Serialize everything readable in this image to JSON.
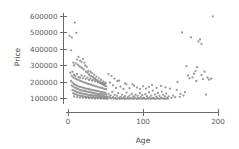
{
  "chart_data": {
    "type": "scatter",
    "title": "",
    "xlabel": "Age",
    "ylabel": "Price",
    "xlim": [
      -8,
      205
    ],
    "ylim": [
      60000,
      625000
    ],
    "grid": false,
    "legend": null,
    "marker_color": "#8a8a8a",
    "axis_color": "#6b6b6b",
    "background": "#ffffff",
    "xticks": [
      0,
      100,
      200
    ],
    "xtick_labels": [
      "0",
      "100",
      "200"
    ],
    "yticks": [
      100000,
      200000,
      300000,
      400000,
      500000,
      600000
    ],
    "ytick_labels": [
      "100000",
      "200000",
      "300000",
      "400000",
      "500000",
      "600000"
    ],
    "points": [
      [
        2,
        480000
      ],
      [
        5,
        470000
      ],
      [
        9,
        560000
      ],
      [
        11,
        498000
      ],
      [
        4,
        392000
      ],
      [
        14,
        352000
      ],
      [
        12,
        336000
      ],
      [
        16,
        330000
      ],
      [
        7,
        318000
      ],
      [
        10,
        312000
      ],
      [
        13,
        305000
      ],
      [
        8,
        300000
      ],
      [
        15,
        296000
      ],
      [
        18,
        322000
      ],
      [
        20,
        340000
      ],
      [
        22,
        318000
      ],
      [
        17,
        290000
      ],
      [
        19,
        284000
      ],
      [
        21,
        276000
      ],
      [
        23,
        300000
      ],
      [
        25,
        292000
      ],
      [
        27,
        268000
      ],
      [
        24,
        262000
      ],
      [
        26,
        256000
      ],
      [
        28,
        248000
      ],
      [
        30,
        262000
      ],
      [
        32,
        254000
      ],
      [
        29,
        240000
      ],
      [
        31,
        236000
      ],
      [
        33,
        230000
      ],
      [
        35,
        244000
      ],
      [
        34,
        226000
      ],
      [
        36,
        220000
      ],
      [
        38,
        232000
      ],
      [
        37,
        214000
      ],
      [
        39,
        208000
      ],
      [
        41,
        222000
      ],
      [
        40,
        204000
      ],
      [
        42,
        198000
      ],
      [
        44,
        212000
      ],
      [
        43,
        194000
      ],
      [
        45,
        190000
      ],
      [
        47,
        202000
      ],
      [
        46,
        186000
      ],
      [
        48,
        182000
      ],
      [
        50,
        196000
      ],
      [
        49,
        178000
      ],
      [
        51,
        174000
      ],
      [
        3,
        256000
      ],
      [
        6,
        262000
      ],
      [
        5,
        238000
      ],
      [
        7,
        228000
      ],
      [
        8,
        244000
      ],
      [
        9,
        222000
      ],
      [
        10,
        236000
      ],
      [
        11,
        218000
      ],
      [
        12,
        248000
      ],
      [
        13,
        214000
      ],
      [
        14,
        230000
      ],
      [
        15,
        210000
      ],
      [
        16,
        226000
      ],
      [
        17,
        206000
      ],
      [
        18,
        240000
      ],
      [
        19,
        202000
      ],
      [
        20,
        222000
      ],
      [
        21,
        198000
      ],
      [
        22,
        234000
      ],
      [
        23,
        196000
      ],
      [
        24,
        218000
      ],
      [
        25,
        192000
      ],
      [
        26,
        226000
      ],
      [
        27,
        188000
      ],
      [
        28,
        212000
      ],
      [
        29,
        186000
      ],
      [
        30,
        220000
      ],
      [
        31,
        184000
      ],
      [
        32,
        208000
      ],
      [
        33,
        180000
      ],
      [
        34,
        214000
      ],
      [
        35,
        178000
      ],
      [
        36,
        204000
      ],
      [
        37,
        174000
      ],
      [
        38,
        210000
      ],
      [
        39,
        172000
      ],
      [
        40,
        198000
      ],
      [
        41,
        168000
      ],
      [
        42,
        202000
      ],
      [
        43,
        166000
      ],
      [
        44,
        192000
      ],
      [
        45,
        164000
      ],
      [
        46,
        196000
      ],
      [
        47,
        160000
      ],
      [
        48,
        188000
      ],
      [
        49,
        158000
      ],
      [
        50,
        190000
      ],
      [
        51,
        156000
      ],
      [
        4,
        206000
      ],
      [
        6,
        196000
      ],
      [
        8,
        188000
      ],
      [
        10,
        182000
      ],
      [
        12,
        178000
      ],
      [
        14,
        174000
      ],
      [
        16,
        170000
      ],
      [
        18,
        168000
      ],
      [
        20,
        166000
      ],
      [
        22,
        162000
      ],
      [
        24,
        160000
      ],
      [
        26,
        158000
      ],
      [
        28,
        156000
      ],
      [
        30,
        154000
      ],
      [
        32,
        152000
      ],
      [
        34,
        150000
      ],
      [
        36,
        148000
      ],
      [
        38,
        146000
      ],
      [
        40,
        144000
      ],
      [
        42,
        142000
      ],
      [
        44,
        140000
      ],
      [
        46,
        138000
      ],
      [
        48,
        136000
      ],
      [
        50,
        134000
      ],
      [
        5,
        178000
      ],
      [
        7,
        172000
      ],
      [
        9,
        166000
      ],
      [
        11,
        162000
      ],
      [
        13,
        158000
      ],
      [
        15,
        154000
      ],
      [
        17,
        150000
      ],
      [
        19,
        148000
      ],
      [
        21,
        146000
      ],
      [
        23,
        144000
      ],
      [
        25,
        142000
      ],
      [
        27,
        140000
      ],
      [
        29,
        138000
      ],
      [
        31,
        136000
      ],
      [
        33,
        134000
      ],
      [
        35,
        132000
      ],
      [
        37,
        130000
      ],
      [
        39,
        128000
      ],
      [
        41,
        127000
      ],
      [
        43,
        126000
      ],
      [
        45,
        125000
      ],
      [
        47,
        124000
      ],
      [
        49,
        123000
      ],
      [
        51,
        122000
      ],
      [
        6,
        152000
      ],
      [
        8,
        148000
      ],
      [
        10,
        144000
      ],
      [
        12,
        140000
      ],
      [
        14,
        137000
      ],
      [
        16,
        134000
      ],
      [
        18,
        131000
      ],
      [
        20,
        129000
      ],
      [
        22,
        127000
      ],
      [
        24,
        125000
      ],
      [
        26,
        123000
      ],
      [
        28,
        121000
      ],
      [
        30,
        120000
      ],
      [
        32,
        119000
      ],
      [
        34,
        118000
      ],
      [
        36,
        117000
      ],
      [
        38,
        116000
      ],
      [
        40,
        115000
      ],
      [
        42,
        114000
      ],
      [
        44,
        113000
      ],
      [
        46,
        112000
      ],
      [
        48,
        111000
      ],
      [
        50,
        110000
      ],
      [
        52,
        110000
      ],
      [
        7,
        132000
      ],
      [
        9,
        128000
      ],
      [
        11,
        124000
      ],
      [
        13,
        121000
      ],
      [
        15,
        118000
      ],
      [
        17,
        116000
      ],
      [
        19,
        114000
      ],
      [
        21,
        112000
      ],
      [
        23,
        110000
      ],
      [
        25,
        109000
      ],
      [
        27,
        108000
      ],
      [
        29,
        107000
      ],
      [
        31,
        106000
      ],
      [
        33,
        106000
      ],
      [
        35,
        105000
      ],
      [
        37,
        105000
      ],
      [
        39,
        104000
      ],
      [
        41,
        104000
      ],
      [
        43,
        103000
      ],
      [
        45,
        103000
      ],
      [
        47,
        102000
      ],
      [
        49,
        102000
      ],
      [
        51,
        101000
      ],
      [
        53,
        101000
      ],
      [
        8,
        112000
      ],
      [
        12,
        108000
      ],
      [
        16,
        106000
      ],
      [
        20,
        104000
      ],
      [
        24,
        103000
      ],
      [
        28,
        102000
      ],
      [
        32,
        101000
      ],
      [
        36,
        100000
      ],
      [
        40,
        100000
      ],
      [
        44,
        100000
      ],
      [
        48,
        99000
      ],
      [
        52,
        99000
      ],
      [
        54,
        128000
      ],
      [
        55,
        112000
      ],
      [
        56,
        102000
      ],
      [
        57,
        118000
      ],
      [
        58,
        100000
      ],
      [
        59,
        140000
      ],
      [
        60,
        108000
      ],
      [
        61,
        99000
      ],
      [
        62,
        122000
      ],
      [
        63,
        104000
      ],
      [
        64,
        98000
      ],
      [
        65,
        116000
      ],
      [
        66,
        100000
      ],
      [
        67,
        132000
      ],
      [
        68,
        102000
      ],
      [
        69,
        98000
      ],
      [
        70,
        110000
      ],
      [
        71,
        100000
      ],
      [
        72,
        124000
      ],
      [
        73,
        99000
      ],
      [
        74,
        106000
      ],
      [
        75,
        98000
      ],
      [
        76,
        114000
      ],
      [
        77,
        100000
      ],
      [
        78,
        136000
      ],
      [
        79,
        99000
      ],
      [
        80,
        108000
      ],
      [
        81,
        98000
      ],
      [
        82,
        118000
      ],
      [
        83,
        100000
      ],
      [
        84,
        102000
      ],
      [
        85,
        128000
      ],
      [
        86,
        99000
      ],
      [
        87,
        112000
      ],
      [
        88,
        98000
      ],
      [
        89,
        106000
      ],
      [
        90,
        122000
      ],
      [
        91,
        100000
      ],
      [
        92,
        98000
      ],
      [
        93,
        116000
      ],
      [
        94,
        102000
      ],
      [
        95,
        99000
      ],
      [
        96,
        132000
      ],
      [
        97,
        108000
      ],
      [
        98,
        98000
      ],
      [
        99,
        120000
      ],
      [
        100,
        100000
      ],
      [
        101,
        104000
      ],
      [
        102,
        99000
      ],
      [
        103,
        126000
      ],
      [
        104,
        98000
      ],
      [
        105,
        114000
      ],
      [
        106,
        102000
      ],
      [
        107,
        99000
      ],
      [
        108,
        138000
      ],
      [
        109,
        106000
      ],
      [
        110,
        98000
      ],
      [
        111,
        118000
      ],
      [
        112,
        100000
      ],
      [
        113,
        148000
      ],
      [
        114,
        103000
      ],
      [
        115,
        99000
      ],
      [
        116,
        124000
      ],
      [
        117,
        98000
      ],
      [
        118,
        110000
      ],
      [
        119,
        101000
      ],
      [
        120,
        134000
      ],
      [
        121,
        99000
      ],
      [
        122,
        116000
      ],
      [
        123,
        98000
      ],
      [
        124,
        105000
      ],
      [
        125,
        142000
      ],
      [
        126,
        100000
      ],
      [
        127,
        122000
      ],
      [
        128,
        99000
      ],
      [
        129,
        112000
      ],
      [
        130,
        98000
      ],
      [
        131,
        130000
      ],
      [
        132,
        103000
      ],
      [
        133,
        99000
      ],
      [
        60,
        180000
      ],
      [
        64,
        164000
      ],
      [
        70,
        172000
      ],
      [
        74,
        158000
      ],
      [
        78,
        186000
      ],
      [
        82,
        162000
      ],
      [
        88,
        178000
      ],
      [
        92,
        166000
      ],
      [
        96,
        158000
      ],
      [
        100,
        174000
      ],
      [
        104,
        160000
      ],
      [
        108,
        170000
      ],
      [
        112,
        182000
      ],
      [
        118,
        164000
      ],
      [
        124,
        176000
      ],
      [
        130,
        168000
      ],
      [
        56,
        196000
      ],
      [
        66,
        206000
      ],
      [
        76,
        192000
      ],
      [
        86,
        186000
      ],
      [
        58,
        236000
      ],
      [
        62,
        220000
      ],
      [
        54,
        248000
      ],
      [
        68,
        208000
      ],
      [
        136,
        160000
      ],
      [
        140,
        118000
      ],
      [
        143,
        108000
      ],
      [
        146,
        200000
      ],
      [
        150,
        128000
      ],
      [
        152,
        500000
      ],
      [
        154,
        118000
      ],
      [
        156,
        138000
      ],
      [
        158,
        296000
      ],
      [
        160,
        240000
      ],
      [
        162,
        222000
      ],
      [
        164,
        470000
      ],
      [
        166,
        228000
      ],
      [
        168,
        250000
      ],
      [
        170,
        266000
      ],
      [
        172,
        290000
      ],
      [
        174,
        446000
      ],
      [
        176,
        458000
      ],
      [
        178,
        242000
      ],
      [
        180,
        218000
      ],
      [
        182,
        262000
      ],
      [
        184,
        124000
      ],
      [
        186,
        226000
      ],
      [
        188,
        214000
      ],
      [
        193,
        598000
      ],
      [
        191,
        220000
      ],
      [
        178,
        430000
      ],
      [
        171,
        206000
      ],
      [
        145,
        152000
      ],
      [
        138,
        104000
      ],
      [
        134,
        112000
      ],
      [
        149,
        110000
      ]
    ]
  },
  "axis_titles": {
    "x": "Age",
    "y": "Price"
  }
}
